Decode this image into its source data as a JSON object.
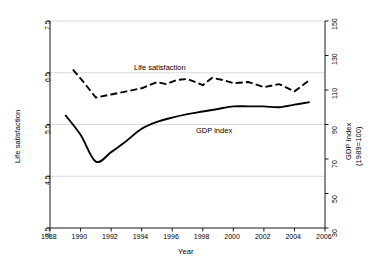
{
  "figure": {
    "background": "#ffffff",
    "line_color": "#000000",
    "grid_color": "#c8c8c8",
    "axis_color": "#000000"
  },
  "labels": {
    "xlabel": "Year",
    "ylabel_left": "Life satisfaction",
    "ylabel_right_line1": "GDP Index",
    "ylabel_right_line2": "(1989=100)",
    "series_life": "Life satisfaction",
    "series_gdp": "GDP index"
  },
  "ticks": {
    "x": [
      "1988",
      "1990",
      "1992",
      "1994",
      "1996",
      "1998",
      "2000",
      "2002",
      "2004",
      "2006"
    ],
    "y_left": [
      "7.5",
      "6.5",
      "5.5",
      "4.5",
      "3.5"
    ],
    "y_right": [
      "150",
      "130",
      "110",
      "90",
      "70",
      "50",
      "30"
    ]
  },
  "chart_data": {
    "type": "line",
    "title": "",
    "xlabel": "Year",
    "ylabel": "Life satisfaction",
    "ylabel_secondary": "GDP Index (1989=100)",
    "xlim": [
      1988,
      2006
    ],
    "ylim": [
      3.5,
      7.5
    ],
    "ylim_secondary": [
      30,
      150
    ],
    "grid": true,
    "gridlines_y": [
      4.5,
      5.5,
      6.5,
      7.5
    ],
    "legend": "inline-annotation",
    "series": [
      {
        "name": "Life satisfaction",
        "axis": "left",
        "style": "dashed",
        "color": "#000000",
        "x": [
          1989.5,
          1990.2,
          1991.0,
          1992.0,
          1993.0,
          1994.0,
          1995.0,
          1995.6,
          1996.3,
          1997.0,
          1998.0,
          1998.6,
          1999.3,
          2000.0,
          2001.0,
          2002.0,
          2003.0,
          2004.0,
          2005.0
        ],
        "values": [
          6.56,
          6.32,
          6.02,
          6.08,
          6.14,
          6.2,
          6.32,
          6.28,
          6.36,
          6.38,
          6.26,
          6.4,
          6.36,
          6.3,
          6.32,
          6.22,
          6.28,
          6.14,
          6.36
        ]
      },
      {
        "name": "GDP index",
        "axis": "right",
        "style": "solid",
        "color": "#000000",
        "x": [
          1989.0,
          1990.0,
          1991.0,
          1992.0,
          1993.0,
          1994.0,
          1995.0,
          1996.0,
          1997.0,
          1998.0,
          1999.0,
          2000.0,
          2001.0,
          2002.0,
          2003.0,
          2004.0,
          2005.0
        ],
        "values": [
          95.5,
          84.0,
          68.5,
          74.0,
          80.5,
          87.5,
          91.5,
          94.0,
          96.0,
          97.5,
          99.0,
          100.5,
          100.5,
          100.5,
          100.0,
          101.5,
          103.0
        ]
      }
    ],
    "annotations": [
      {
        "text": "Life satisfaction",
        "x": 1994.6,
        "y": 6.62
      },
      {
        "text": "GDP index",
        "x": 1998.3,
        "y": 5.47
      }
    ]
  }
}
